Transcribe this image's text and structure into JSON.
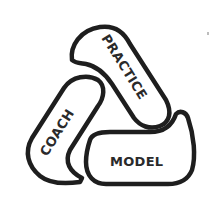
{
  "diagram": {
    "type": "cycle-logo",
    "segments": [
      {
        "id": "practice",
        "label": "PRACTICE"
      },
      {
        "id": "coach",
        "label": "COACH"
      },
      {
        "id": "model",
        "label": "MODEL"
      }
    ],
    "colors": {
      "stroke": "#1e1e1e",
      "fill": "#ffffff",
      "text": "#2a2a2a"
    }
  }
}
